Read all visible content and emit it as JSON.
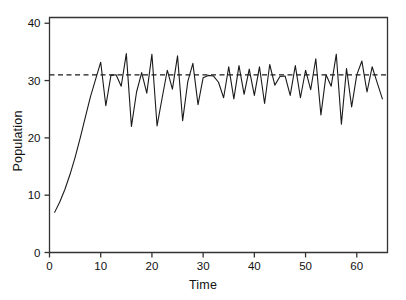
{
  "chart_data": {
    "type": "line",
    "title": "",
    "xlabel": "Time",
    "ylabel": "Population",
    "xlim": [
      0,
      66
    ],
    "ylim": [
      0,
      41
    ],
    "xticks": [
      0,
      10,
      20,
      30,
      40,
      50,
      60
    ],
    "yticks": [
      0,
      10,
      20,
      30,
      40
    ],
    "xtick_labels": [
      "0",
      "10",
      "20",
      "30",
      "40",
      "50",
      "60"
    ],
    "ytick_labels": [
      "0",
      "10",
      "20",
      "30",
      "40"
    ],
    "grid": false,
    "legend": null,
    "line_color": "#1a1a1a",
    "reference_line": {
      "name": "equilibrium",
      "orientation": "horizontal",
      "value": 31,
      "style": "dashed",
      "color": "#1a1a1a"
    },
    "series": [
      {
        "name": "Population",
        "x": [
          1,
          2,
          3,
          4,
          5,
          6,
          7,
          8,
          9,
          10,
          11,
          12,
          13,
          14,
          15,
          16,
          17,
          18,
          19,
          20,
          21,
          22,
          23,
          24,
          25,
          26,
          27,
          28,
          29,
          30,
          31,
          32,
          33,
          34,
          35,
          36,
          37,
          38,
          39,
          40,
          41,
          42,
          43,
          44,
          45,
          46,
          47,
          48,
          49,
          50,
          51,
          52,
          53,
          54,
          55,
          56,
          57,
          58,
          59,
          60,
          61,
          62,
          63,
          64,
          65
        ],
        "values": [
          7.0,
          8.8,
          11.0,
          13.6,
          16.6,
          20.0,
          23.6,
          27.2,
          30.2,
          33.2,
          25.6,
          30.9,
          31.0,
          29.0,
          34.7,
          22.0,
          28.0,
          31.4,
          27.8,
          34.6,
          22.1,
          27.0,
          31.8,
          28.5,
          34.3,
          23.0,
          29.8,
          33.0,
          25.8,
          30.5,
          30.9,
          30.8,
          29.7,
          27.0,
          32.4,
          26.8,
          32.6,
          27.6,
          32.0,
          27.4,
          32.4,
          26.0,
          32.8,
          29.2,
          30.7,
          30.8,
          27.4,
          32.6,
          27.0,
          31.8,
          28.4,
          33.8,
          24.0,
          31.0,
          29.0,
          34.6,
          22.4,
          32.1,
          25.4,
          31.0,
          33.4,
          28.0,
          32.4,
          29.6,
          26.8
        ]
      }
    ]
  },
  "figure": {
    "background_color": "#ffffff",
    "axes_color": "#333333"
  }
}
